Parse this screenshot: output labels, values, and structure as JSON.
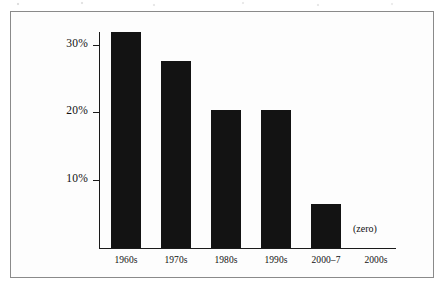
{
  "chart_data": {
    "type": "bar",
    "title": "",
    "subtitle": "",
    "xlabel": "",
    "ylabel": "",
    "categories": [
      "1960s",
      "1970s",
      "1980s",
      "1990s",
      "2000–7",
      "2000s"
    ],
    "values": [
      31.8,
      27.6,
      20.3,
      20.3,
      6.5,
      0
    ],
    "ylim": [
      0,
      34
    ],
    "ytick_values": [
      10,
      20,
      30
    ],
    "ytick_labels": [
      "10%",
      "20%",
      "30%"
    ],
    "grid": false,
    "legend": null,
    "bar_color": "#131313",
    "axis_color": "#1a1a1a",
    "frame_color": "#8a8a8a",
    "background_color": "#fdfdfd",
    "annotations": [
      {
        "name": "zero-annotation",
        "text": "(zero)",
        "attached_to_category": "2000s",
        "meaning": "the 2000s bar has a value of zero"
      }
    ]
  }
}
